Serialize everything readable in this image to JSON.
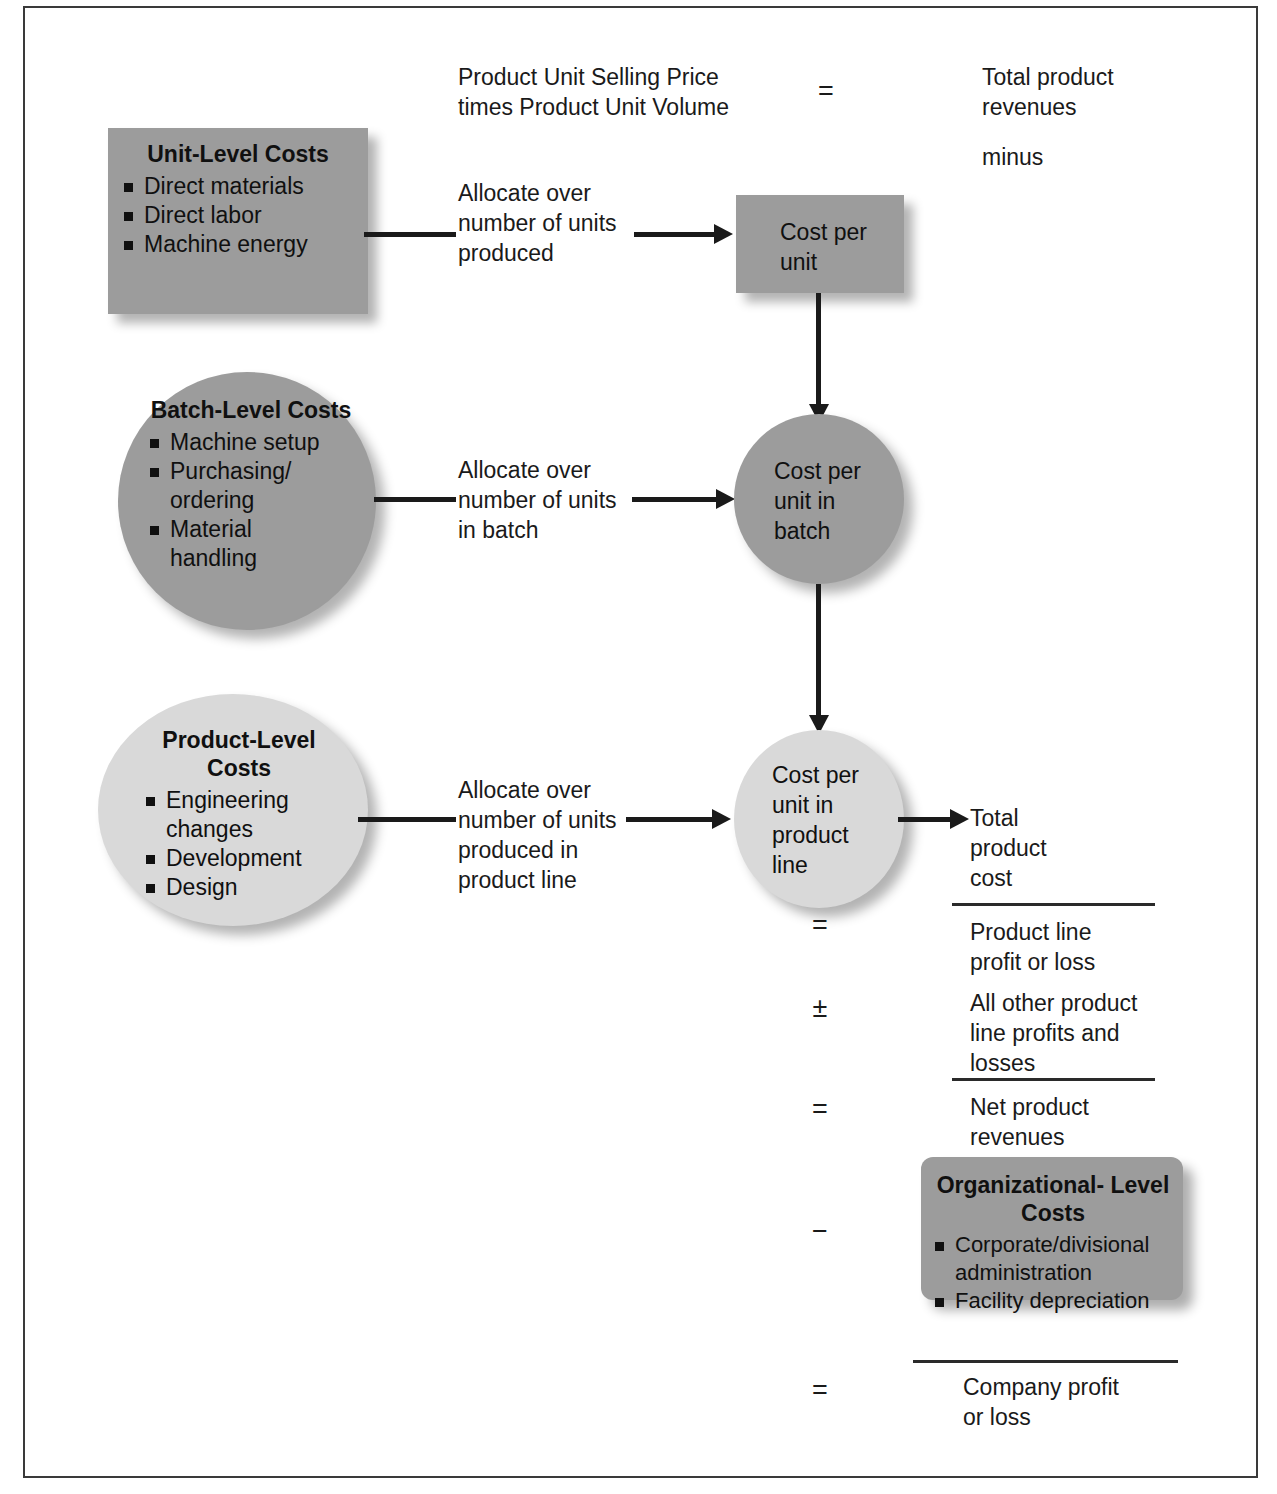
{
  "diagram": {
    "colors": {
      "shape_dark_gray": "#9c9c9c",
      "shape_light_gray": "#d9d9d9",
      "line_black": "#1a1a1a",
      "frame_border": "#3a3a3a",
      "text": "#1a1a1a"
    }
  },
  "revenue_header": {
    "formula": "Product Unit Selling Price\ntimes Product Unit Volume",
    "operator": "=",
    "result": "Total product\nrevenues",
    "minus_label": "minus"
  },
  "cost_levels": [
    {
      "id": "unit-level",
      "shape": "rectangle",
      "fill": "dark",
      "title": "Unit-Level\nCosts",
      "items": [
        "Direct materials",
        "Direct labor",
        "Machine energy"
      ],
      "allocation_label": "Allocate over\nnumber of units\nproduced",
      "target": {
        "id": "cost-per-unit",
        "shape": "rectangle",
        "fill": "dark",
        "label": "Cost per\nunit"
      }
    },
    {
      "id": "batch-level",
      "shape": "circle",
      "fill": "dark",
      "title": "Batch-Level\nCosts",
      "items": [
        "Machine setup",
        "Purchasing/\nordering",
        "Material\nhandling"
      ],
      "allocation_label": "Allocate over\nnumber of units\nin batch",
      "target": {
        "id": "cost-per-unit-in-batch",
        "shape": "circle",
        "fill": "dark",
        "label": "Cost per\nunit in\nbatch"
      }
    },
    {
      "id": "product-level",
      "shape": "circle",
      "fill": "light",
      "title": "Product-Level\nCosts",
      "items": [
        "Engineering\nchanges",
        "Development",
        "Design"
      ],
      "allocation_label": "Allocate over\nnumber of units\nproduced in\nproduct line",
      "target": {
        "id": "cost-per-unit-in-product-line",
        "shape": "circle",
        "fill": "light",
        "label": "Cost per\nunit in\nproduct\nline"
      }
    }
  ],
  "income_statement": {
    "lines": [
      {
        "operator": "",
        "label": "Total\nproduct\ncost",
        "rule_after": true
      },
      {
        "operator": "=",
        "label": "Product line\nprofit or loss",
        "rule_after": false
      },
      {
        "operator": "±",
        "label": "All other product\nline profits and\nlosses",
        "rule_after": true
      },
      {
        "operator": "=",
        "label": "Net product\nrevenues",
        "rule_after": false
      },
      {
        "operator": "−",
        "label": "",
        "rule_after": true
      },
      {
        "operator": "=",
        "label": "Company profit\nor loss",
        "rule_after": false
      }
    ]
  },
  "organizational_costs": {
    "shape": "rounded-rectangle",
    "fill": "dark",
    "title": "Organizational-\nLevel Costs",
    "items": [
      "Corporate/divisional\nadministration",
      "Facility depreciation"
    ]
  }
}
